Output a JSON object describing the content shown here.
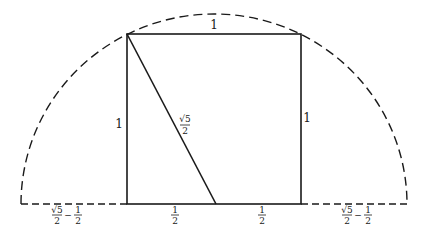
{
  "diagram": {
    "colors": {
      "stroke": "#1a1a1a",
      "background": "#ffffff"
    },
    "labels": {
      "top_side": "1",
      "left_side": "1",
      "right_side": "1",
      "diagonal": {
        "num": "√5",
        "den": "2"
      },
      "bottom_left_half": {
        "num": "1",
        "den": "2"
      },
      "bottom_right_half": {
        "num": "1",
        "den": "2"
      },
      "left_extension": {
        "a_num": "√5",
        "a_den": "2",
        "op": "−",
        "b_num": "1",
        "b_den": "2"
      },
      "right_extension": {
        "a_num": "√5",
        "a_den": "2",
        "op": "−",
        "b_num": "1",
        "b_den": "2"
      }
    }
  }
}
